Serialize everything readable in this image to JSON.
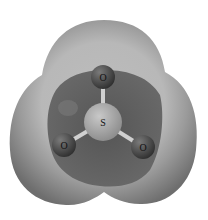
{
  "figure": {
    "atoms": [
      {
        "id": "sulfur",
        "label": "S",
        "cx": 103,
        "cy": 122,
        "r": 19,
        "color": "#9a9a9a"
      },
      {
        "id": "oxygen-top",
        "label": "O",
        "cx": 103,
        "cy": 77,
        "r": 12,
        "color": "#4a4a4a"
      },
      {
        "id": "oxygen-left",
        "label": "O",
        "cx": 64,
        "cy": 145,
        "r": 12,
        "color": "#4a4a4a"
      },
      {
        "id": "oxygen-right",
        "label": "O",
        "cx": 143,
        "cy": 147,
        "r": 12,
        "color": "#4a4a4a"
      }
    ],
    "colors": {
      "outer_surface": "#8c8c8c",
      "surface_highlight": "#c4c4c4",
      "inner_region": "#5e5e5e",
      "bond": "#d0d0d0",
      "background": "#ffffff"
    }
  }
}
